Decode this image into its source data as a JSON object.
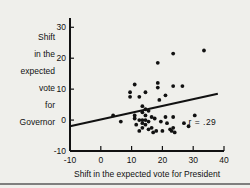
{
  "chart_data": {
    "type": "scatter",
    "title": "",
    "xlabel": "Shift in the expected vote for President",
    "ylabel": "Shift in the expected vote for Governor",
    "ylabel_lines": [
      "Shift",
      "in the",
      "expected",
      "vote",
      "for",
      "Governor"
    ],
    "xlim": [
      -10,
      40
    ],
    "ylim": [
      -10,
      33
    ],
    "xticks": [
      -10,
      0,
      10,
      20,
      30,
      40
    ],
    "xtick_labels": [
      "-10",
      "0",
      "10",
      "20",
      "30",
      "40"
    ],
    "yticks": [
      -10,
      0,
      10,
      20,
      30
    ],
    "ytick_labels": [
      "-10",
      "0",
      "10",
      "20",
      "30"
    ],
    "grid": false,
    "legend": "none",
    "annotations": [
      {
        "text": "r = .29",
        "x": 33,
        "y": -1.5
      }
    ],
    "correlation_label": "r = .29",
    "correlation_value": 0.29,
    "fit_line": {
      "x0": -10,
      "y0": -2.0,
      "x1": 38,
      "y1": 8.5
    },
    "points": [
      {
        "x": 4.0,
        "y": 1.5
      },
      {
        "x": 6.5,
        "y": -0.5
      },
      {
        "x": 9.5,
        "y": 9.0
      },
      {
        "x": 9.5,
        "y": 7.5
      },
      {
        "x": 11.0,
        "y": 11.5
      },
      {
        "x": 11.0,
        "y": 1.5
      },
      {
        "x": 11.0,
        "y": 0.5
      },
      {
        "x": 11.5,
        "y": -1.5
      },
      {
        "x": 12.5,
        "y": 7.5
      },
      {
        "x": 12.5,
        "y": 0.0
      },
      {
        "x": 12.5,
        "y": -3.5
      },
      {
        "x": 13.5,
        "y": 4.5
      },
      {
        "x": 13.5,
        "y": 2.5
      },
      {
        "x": 13.5,
        "y": 0.0
      },
      {
        "x": 13.5,
        "y": -1.0
      },
      {
        "x": 13.5,
        "y": -2.5
      },
      {
        "x": 14.5,
        "y": 9.0
      },
      {
        "x": 14.5,
        "y": 3.5
      },
      {
        "x": 14.5,
        "y": 1.5
      },
      {
        "x": 14.5,
        "y": 0.0
      },
      {
        "x": 14.5,
        "y": -1.5
      },
      {
        "x": 15.5,
        "y": 3.0
      },
      {
        "x": 15.5,
        "y": -0.5
      },
      {
        "x": 15.5,
        "y": -3.0
      },
      {
        "x": 16.5,
        "y": 1.0
      },
      {
        "x": 16.5,
        "y": -2.5
      },
      {
        "x": 17.0,
        "y": -4.0
      },
      {
        "x": 17.5,
        "y": 0.5
      },
      {
        "x": 18.0,
        "y": -3.5
      },
      {
        "x": 18.5,
        "y": 18.5
      },
      {
        "x": 18.5,
        "y": 12.0
      },
      {
        "x": 18.5,
        "y": 10.5
      },
      {
        "x": 19.0,
        "y": 6.5
      },
      {
        "x": 19.5,
        "y": -0.5
      },
      {
        "x": 20.0,
        "y": -3.5
      },
      {
        "x": 21.0,
        "y": 8.0
      },
      {
        "x": 21.0,
        "y": 1.0
      },
      {
        "x": 21.5,
        "y": -1.0
      },
      {
        "x": 22.5,
        "y": -3.0
      },
      {
        "x": 23.0,
        "y": -3.5
      },
      {
        "x": 23.5,
        "y": 21.5
      },
      {
        "x": 23.5,
        "y": 11.0
      },
      {
        "x": 23.5,
        "y": 1.0
      },
      {
        "x": 23.5,
        "y": -2.5
      },
      {
        "x": 24.0,
        "y": -4.0
      },
      {
        "x": 26.5,
        "y": 11.0
      },
      {
        "x": 27.0,
        "y": -1.0
      },
      {
        "x": 28.5,
        "y": -2.0
      },
      {
        "x": 30.5,
        "y": 1.5
      },
      {
        "x": 33.5,
        "y": 22.5
      }
    ]
  }
}
